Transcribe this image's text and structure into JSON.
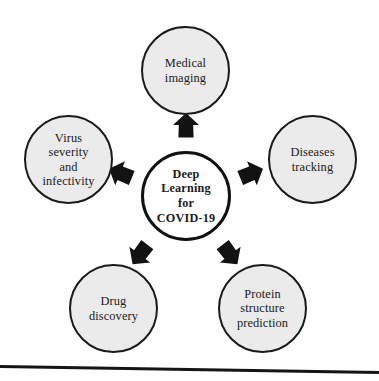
{
  "figure": {
    "name": "deep-learning-covid19-applications-diagram",
    "background_color": "#ffffff",
    "node_fill_color": "#ebebeb",
    "center_fill_color": "#ffffff",
    "outline_color": "#1a1a1a",
    "arrow_color": "#121212"
  },
  "center": {
    "label": "Deep\nLearning\nfor\nCOVID-19",
    "lines": [
      "Deep",
      "Learning",
      "for",
      "COVID-19"
    ],
    "x": 186,
    "y": 196
  },
  "nodes": [
    {
      "id": "medical-imaging",
      "label": "Medical\nimaging",
      "lines": [
        "Medical",
        "imaging"
      ],
      "position": "top",
      "x": 186,
      "y": 71
    },
    {
      "id": "diseases-tracking",
      "label": "Diseases\ntracking",
      "lines": [
        "Diseases",
        "tracking"
      ],
      "position": "right",
      "x": 313,
      "y": 160
    },
    {
      "id": "protein-structure-prediction",
      "label": "Protein\nstructure\nprediction",
      "lines": [
        "Protein",
        "structure",
        "prediction"
      ],
      "position": "bottom-right",
      "x": 263,
      "y": 309
    },
    {
      "id": "drug-discovery",
      "label": "Drug\ndiscovery",
      "lines": [
        "Drug",
        "discovery"
      ],
      "position": "bottom-left",
      "x": 114,
      "y": 309
    },
    {
      "id": "virus-severity-and-infectivity",
      "label": "Virus\nseverity\nand\ninfectivity",
      "lines": [
        "Virus",
        "severity",
        "and",
        "infectivity"
      ],
      "position": "left",
      "x": 69,
      "y": 160
    }
  ],
  "arrows": [
    {
      "id": "arrow-to-medical-imaging",
      "direction": "up",
      "rotation": 0,
      "x": 186,
      "y": 127
    },
    {
      "id": "arrow-to-diseases-tracking",
      "direction": "up-right",
      "rotation": 68,
      "x": 250,
      "y": 174
    },
    {
      "id": "arrow-to-protein-structure-prediction",
      "direction": "down-right",
      "rotation": 143,
      "x": 229,
      "y": 253
    },
    {
      "id": "arrow-to-drug-discovery",
      "direction": "down-left",
      "rotation": 217,
      "x": 141,
      "y": 253
    },
    {
      "id": "arrow-to-virus-severity",
      "direction": "up-left",
      "rotation": 292,
      "x": 122,
      "y": 174
    }
  ],
  "baseline": {
    "id": "bottom-rule",
    "y": 366,
    "tilt_degrees": 0.9
  }
}
